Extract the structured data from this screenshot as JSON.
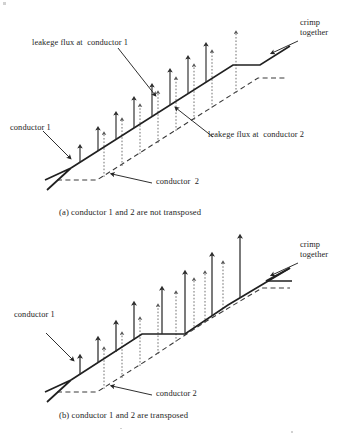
{
  "document": {
    "type": "technical-line-diagram",
    "subject": "leakage flux of two parallel conductors, transposed vs not transposed",
    "background_color": "#ffffff",
    "ink_color": "#242424"
  },
  "figure_a": {
    "caption": "(a) conductor 1 and 2 are not transposed",
    "labels": {
      "flux_c1": "leakege flux at  conductor 1",
      "flux_c2": "leakege flux at  conductor 2",
      "conductor1": "conductor 1",
      "conductor2": "conductor  2",
      "crimp_line1": "crimp",
      "crimp_line2": "together"
    },
    "conductor1_style": "solid",
    "conductor2_style": "dashed",
    "arrow_pairs": 8,
    "transposed": false
  },
  "figure_b": {
    "caption": "(b) conductor 1 and 2 are transposed",
    "labels": {
      "conductor1": "conductor 1",
      "conductor2": "conductor 2",
      "crimp_line1": "crimp",
      "crimp_line2": "together"
    },
    "conductor1_style": "solid",
    "conductor2_style": "dashed",
    "arrow_pairs": 8,
    "transposed": true
  }
}
